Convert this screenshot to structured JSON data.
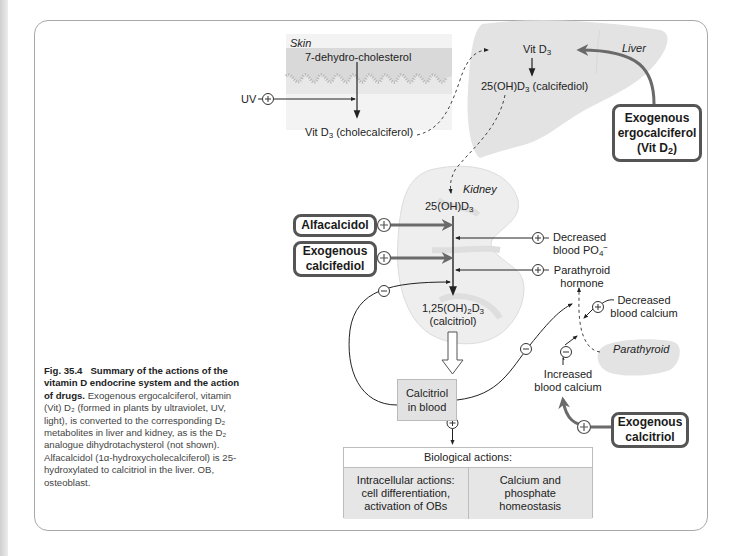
{
  "figure": {
    "number": "Fig. 35.4",
    "title": "Summary of the actions of the vitamin D endocrine system and the action of drugs.",
    "caption_body": "Exogenous ergocalciferol, vitamin (Vit) D2 (formed in plants by ultraviolet, UV, light), is converted to the corresponding D2 metabolites in liver and kidney, as is the D2 analogue dihydrotachysterol (not shown). Alfacalcidol (1α-hydroxycholecalciferol) is 25-hydroxylated to calcitriol in the liver. OB, osteoblast.",
    "caption_lines": [
      "Exogenous",
      "ergocalciferol, vitamin (Vit) D₂ (formed",
      "in plants by ultraviolet, UV, light), is",
      "converted to the corresponding D₂",
      "metabolites in liver and kidney, as is",
      "the D₂ analogue dihydrotachysterol",
      "(not shown). Alfacalcidol",
      "(1α-hydroxycholecalciferol) is",
      "25-hydroxylated to calcitriol in the liver.",
      "OB, osteoblast."
    ]
  },
  "organs": {
    "skin": "Skin",
    "liver": "Liver",
    "kidney": "Kidney",
    "parathyroid": "Parathyroid"
  },
  "skin": {
    "precursor": "7-dehydro-cholesterol",
    "uv": "UV",
    "product_prefix": "Vit D",
    "product_sub": "3",
    "product_suffix": " (cholecalciferol)"
  },
  "liver": {
    "input_prefix": "Vit D",
    "input_sub": "3",
    "product_prefix": "25(OH)D",
    "product_sub": "3",
    "product_suffix": " (calcifediol)"
  },
  "kidney": {
    "input_prefix": "25(OH)D",
    "input_sub": "3",
    "product_line1_a": "1,25(OH)",
    "product_line1_sub1": "2",
    "product_line1_b": "D",
    "product_line1_sub2": "3",
    "product_line2": "(calcitriol)"
  },
  "stimuli": {
    "decreased_phosphate_line1": "Decreased",
    "decreased_phosphate_line2": "blood PO",
    "decreased_phosphate_sub": "4",
    "decreased_phosphate_sup": "−",
    "pth_line1": "Parathyroid",
    "pth_line2": "hormone",
    "decreased_calcium_line1": "Decreased",
    "decreased_calcium_line2": "blood calcium",
    "increased_calcium_line1": "Increased",
    "increased_calcium_line2": "blood calcium"
  },
  "drugs": {
    "ergocalciferol_line1": "Exogenous",
    "ergocalciferol_line2": "ergocalciferol",
    "ergocalciferol_line3_prefix": "(Vit D",
    "ergocalciferol_line3_sub": "2",
    "ergocalciferol_line3_suffix": ")",
    "alfacalcidol": "Alfacalcidol",
    "calcifediol_line1": "Exogenous",
    "calcifediol_line2": "calcifediol",
    "calcitriol_line1": "Exogenous",
    "calcitriol_line2": "calcitriol"
  },
  "blood": {
    "line1": "Calcitriol",
    "line2": "in blood"
  },
  "biological_actions": {
    "header": "Biological actions:",
    "cells": [
      {
        "lines": [
          "Intracellular actions:",
          "cell differentiation,",
          "activation of OBs"
        ]
      },
      {
        "lines": [
          "Calcium and",
          "phosphate",
          "homeostasis"
        ]
      }
    ]
  },
  "symbols": {
    "plus": "+",
    "minus": "−"
  },
  "colors": {
    "organ_fill": "#e3e3e3",
    "skin_band": "#d9d9d9",
    "drug_border": "#555555",
    "drug_arrow": "#6a6a6a",
    "frame_border": "#a8a8a8",
    "calcitriol_box": "#e2e2e2"
  }
}
